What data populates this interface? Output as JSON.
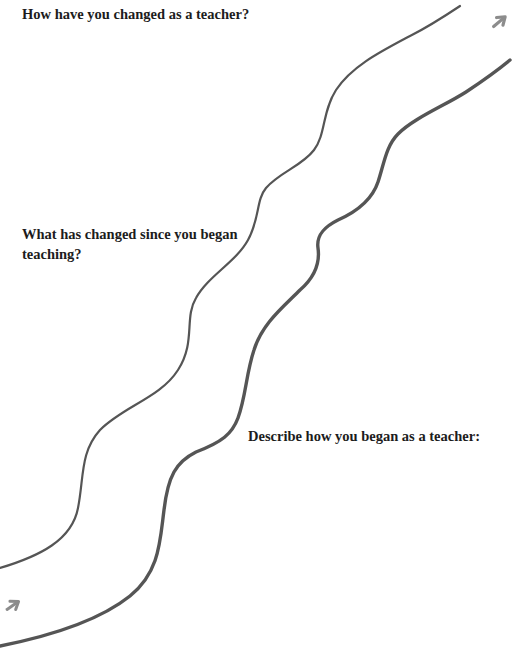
{
  "worksheet": {
    "prompts": [
      {
        "id": "top",
        "text": "How have you changed as a teacher?"
      },
      {
        "id": "middle",
        "text": "What has changed since you began teaching?"
      },
      {
        "id": "bottom",
        "text": "Describe how you began as a teacher:"
      }
    ],
    "path": {
      "description": "winding path from bottom-left to top-right",
      "stroke_color": "#555555",
      "arrow_color": "#8c8c8c",
      "arrows": [
        {
          "position": "bottom-left",
          "direction": "up-right"
        },
        {
          "position": "top-right",
          "direction": "up-right"
        }
      ]
    }
  }
}
